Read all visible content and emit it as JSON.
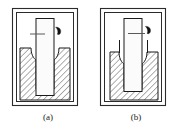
{
  "figure": {
    "type": "technical-cross-section-diagram",
    "panels": [
      {
        "id": "a",
        "caption": "(a)",
        "frame": {
          "x": 12,
          "y": 8,
          "width": 66,
          "height": 98
        },
        "container": {
          "outer_x": 20,
          "outer_y": 48,
          "outer_width": 50,
          "outer_height": 52,
          "wall_thickness": 11,
          "hatch_angle_deg": 45,
          "hatch_spacing": 4
        },
        "rod": {
          "x": 36,
          "y": 18,
          "width": 18,
          "height": 78
        },
        "meniscus": {
          "style": "concave",
          "side": "both",
          "depth": 9
        },
        "walls_extended": false,
        "leader_line": {
          "x1": 30,
          "y1": 34,
          "x2": 45,
          "y2": 34
        },
        "droplet": {
          "cx": 58,
          "cy": 31,
          "r": 3.2
        }
      },
      {
        "id": "b",
        "caption": "(b)",
        "frame": {
          "x": 100,
          "y": 8,
          "width": 66,
          "height": 98
        },
        "container": {
          "outer_x": 110,
          "outer_y": 52,
          "outer_width": 48,
          "outer_height": 48,
          "wall_thickness": 11,
          "hatch_angle_deg": 45,
          "hatch_spacing": 4
        },
        "rod": {
          "x": 124,
          "y": 18,
          "width": 18,
          "height": 74
        },
        "meniscus": {
          "style": "concave",
          "side": "both",
          "depth": 9
        },
        "walls_extended": true,
        "wall_extension_height": 16,
        "leader_line": {
          "x1": 128,
          "y1": 34,
          "x2": 145,
          "y2": 34
        },
        "droplet": {
          "cx": 148,
          "cy": 30,
          "r": 3.2
        }
      }
    ],
    "colors": {
      "frame_stroke": "#2b2b2b",
      "line_stroke": "#1a1a1a",
      "hatch_stroke": "#2b2b2b",
      "fill_light": "#f2f2f2",
      "rod_fill": "#fbfbfb",
      "droplet_fill": "#111111",
      "background": "#ffffff",
      "caption_color": "#1a1a1a"
    },
    "captions": {
      "panel_a": "(a)",
      "panel_b": "(b)"
    }
  }
}
